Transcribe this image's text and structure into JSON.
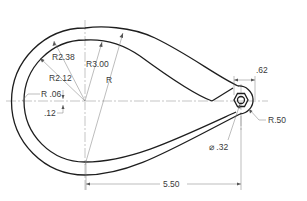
{
  "drawing": {
    "title": "Teardrop link plate with hex pivot",
    "dimensions": {
      "r_outer_mid": "R2.38",
      "r_inner": "R2.12",
      "r_outer": "R3.00",
      "r_unspecified": "R",
      "r_fillet": "R .06",
      "offset": ".12",
      "hex_width": ".62",
      "hex_boss_radius": "R.50",
      "hole_dia": "⌀ .32",
      "center_distance": "5.50"
    },
    "colors": {
      "object_line": "#1e1e1e",
      "dimension_line": "#7a7a7a",
      "text": "#3a3a3a"
    }
  }
}
